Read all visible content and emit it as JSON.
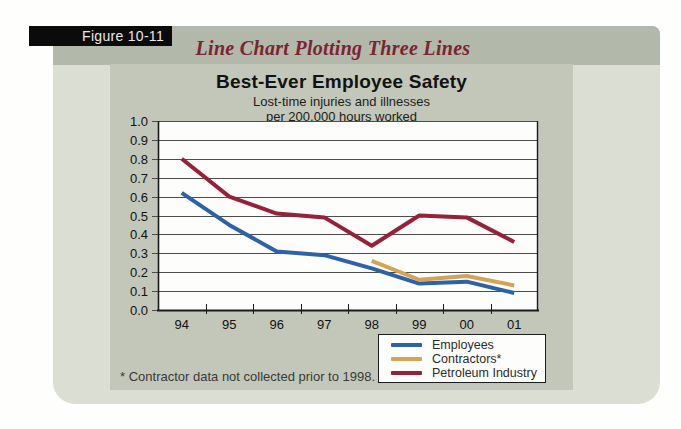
{
  "figure": {
    "tab_label": "Figure 10-11",
    "title": "Line Chart Plotting Three Lines"
  },
  "chart": {
    "title": "Best-Ever Employee Safety",
    "subtitle_line1": "Lost-time injuries and illnesses",
    "subtitle_line2": "per 200,000 hours worked",
    "footnote": "* Contractor data not collected prior to 1998."
  },
  "chart_data": {
    "type": "line",
    "title": "Best-Ever Employee Safety",
    "subtitle": "Lost-time injuries and illnesses per 200,000 hours worked",
    "categories": [
      "94",
      "95",
      "96",
      "97",
      "98",
      "99",
      "00",
      "01"
    ],
    "series": [
      {
        "name": "Employees",
        "color": "#2b62a8",
        "values": [
          0.62,
          0.45,
          0.31,
          0.29,
          0.22,
          0.14,
          0.15,
          0.09
        ]
      },
      {
        "name": "Contractors*",
        "color": "#d4a456",
        "values": [
          null,
          null,
          null,
          null,
          0.26,
          0.16,
          0.18,
          0.13
        ]
      },
      {
        "name": "Petroleum Industry",
        "color": "#97203a",
        "values": [
          0.8,
          0.6,
          0.51,
          0.49,
          0.34,
          0.5,
          0.49,
          0.36
        ]
      }
    ],
    "ylim": [
      0.0,
      1.0
    ],
    "ytick_step": 0.1,
    "y_tick_labels": [
      "0.0",
      "0.1",
      "0.2",
      "0.3",
      "0.4",
      "0.5",
      "0.6",
      "0.7",
      "0.8",
      "0.9",
      "1.0"
    ],
    "grid": "horizontal",
    "legend_position": "bottom-right",
    "footnote": "* Contractor data not collected prior to 1998."
  },
  "colors": {
    "page_background": "#fefefc",
    "card_background": "#dbdfd3",
    "header_band": "#b2b8aa",
    "panel_background": "#c2c7b9",
    "plot_background": "#fdfdfb",
    "gridline": "#4d4d4b",
    "axis": "#1a1a1a",
    "tab_background": "#0b0b0b",
    "tab_text": "#eceae6",
    "figure_title_text": "#7d2433",
    "employees_line": "#2b62a8",
    "contractors_line": "#d4a456",
    "petroleum_line": "#97203a"
  }
}
